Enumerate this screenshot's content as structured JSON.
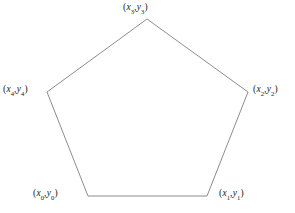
{
  "figure": {
    "background_color": "#ffffff",
    "stroke_color": "#808080",
    "stroke_width": 0.9,
    "text_color": "#1a1a1a",
    "width": 295,
    "height": 213
  },
  "chart_data": {
    "type": "scatter",
    "title": "",
    "xlabel": "",
    "ylabel": "",
    "grid": false,
    "legend": null,
    "shape": "pentagon",
    "closed": true,
    "xlim": [
      0,
      295
    ],
    "ylim": [
      0,
      213
    ],
    "categories": [
      "v0",
      "v1",
      "v2",
      "v3",
      "v4"
    ],
    "x": [
      88,
      207,
      248,
      147,
      47
    ],
    "y": [
      196,
      196,
      92,
      19,
      92
    ],
    "point_labels": [
      "(x_0,y_0)",
      "(x_1,y_1)",
      "(x_2,y_2)",
      "(x_3,y_3)",
      "(x_4,y_4)"
    ],
    "polygon_points": "147,19 248,92 207,196 88,196 47,92"
  },
  "labels": {
    "top": {
      "open": "(",
      "x_var": "x",
      "x_sub": "3",
      "comma": ",",
      "y_var": "y",
      "y_sub": "3",
      "close": ")"
    },
    "right": {
      "open": "(",
      "x_var": "x",
      "x_sub": "2",
      "comma": ",",
      "y_var": "y",
      "y_sub": "2",
      "close": ")"
    },
    "bottom_right": {
      "open": "(",
      "x_var": "x",
      "x_sub": "1",
      "comma": ",",
      "y_var": "y",
      "y_sub": "1",
      "close": ")"
    },
    "bottom_left": {
      "open": "(",
      "x_var": "x",
      "x_sub": "0",
      "comma": ",",
      "y_var": "y",
      "y_sub": "0",
      "close": ")"
    },
    "left": {
      "open": "(",
      "x_var": "x",
      "x_sub": "4",
      "comma": ",",
      "y_var": "y",
      "y_sub": "4",
      "close": ")"
    }
  }
}
